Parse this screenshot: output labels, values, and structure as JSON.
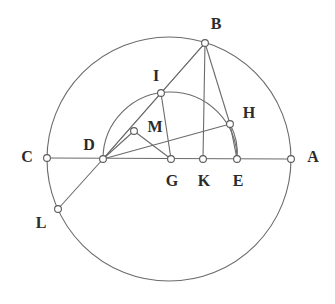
{
  "figure": {
    "background_color": "#ffffff",
    "stroke_color": "#6b6b6b",
    "label_color": "#2b2b2b",
    "vertex_fill": "#ffffff",
    "width": 335,
    "height": 304
  },
  "points": [
    {
      "name": "A",
      "label": "A",
      "x": 291,
      "y": 159,
      "label_x": 313,
      "label_y": 157
    },
    {
      "name": "B",
      "label": "B",
      "x": 205,
      "y": 43,
      "label_x": 216,
      "label_y": 24
    },
    {
      "name": "C",
      "label": "C",
      "x": 47,
      "y": 158,
      "label_x": 27,
      "label_y": 157
    },
    {
      "name": "D",
      "label": "D",
      "x": 103,
      "y": 159,
      "label_x": 89,
      "label_y": 145
    },
    {
      "name": "E",
      "label": "E",
      "x": 237,
      "y": 159,
      "label_x": 238,
      "label_y": 181
    },
    {
      "name": "G",
      "label": "G",
      "x": 171,
      "y": 159,
      "label_x": 172,
      "label_y": 181
    },
    {
      "name": "H",
      "label": "H",
      "x": 230,
      "y": 124,
      "label_x": 249,
      "label_y": 113
    },
    {
      "name": "I",
      "label": "I",
      "x": 161,
      "y": 93,
      "label_x": 156,
      "label_y": 76
    },
    {
      "name": "K",
      "label": "K",
      "x": 203,
      "y": 159,
      "label_x": 204,
      "label_y": 181
    },
    {
      "name": "L",
      "label": "L",
      "x": 58,
      "y": 209,
      "label_x": 41,
      "label_y": 223
    },
    {
      "name": "M",
      "label": "M",
      "x": 134,
      "y": 131,
      "label_x": 155,
      "label_y": 127
    }
  ],
  "circles": [
    {
      "name": "main-circle",
      "cx": 169,
      "cy": 159,
      "r": 122
    },
    {
      "name": "semicircle-de",
      "cx": 170,
      "cy": 159,
      "r": 67,
      "arc": "upper-half"
    }
  ],
  "segments": [
    {
      "name": "segment-CA",
      "from": "C",
      "to": "A"
    },
    {
      "name": "segment-DB",
      "from": "D",
      "to": "B"
    },
    {
      "name": "segment-BI",
      "from": "B",
      "to": "I"
    },
    {
      "name": "segment-BK",
      "from": "B",
      "to": "K"
    },
    {
      "name": "segment-BE",
      "from": "B",
      "to": "E"
    },
    {
      "name": "segment-DI",
      "from": "D",
      "to": "I"
    },
    {
      "name": "segment-DH",
      "from": "D",
      "to": "H"
    },
    {
      "name": "segment-DM",
      "from": "D",
      "to": "M"
    },
    {
      "name": "segment-IG",
      "from": "I",
      "to": "G"
    },
    {
      "name": "segment-HE",
      "from": "H",
      "to": "E"
    },
    {
      "name": "segment-DL",
      "from": "D",
      "to": "L"
    }
  ],
  "arcs": [
    {
      "name": "arc-DMI",
      "from": "D",
      "through": "M",
      "to": "I"
    },
    {
      "name": "arc-HE-small",
      "from": "H",
      "to": "E"
    }
  ]
}
